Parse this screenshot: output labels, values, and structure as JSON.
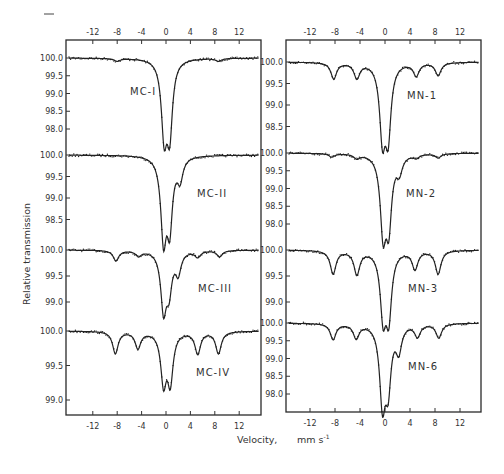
{
  "chart_data": [
    {
      "type": "line",
      "panel": "left",
      "title": "",
      "xlabel": "Velocity, mm s-1",
      "ylabel": "Relative transmission",
      "xlim": [
        -15,
        15
      ],
      "x_ticks": [
        "-12",
        "-8",
        "-4",
        "0",
        "4",
        "8",
        "12"
      ],
      "series": [
        {
          "name": "MC-I",
          "y_ticks": [
            "100.0",
            "99.5",
            "99.0",
            "98.5",
            "98.0"
          ],
          "baseline": 100.0,
          "peaks": [
            {
              "x": -8.0,
              "depth": 0.08
            },
            {
              "x": -0.3,
              "depth": 2.05
            },
            {
              "x": 0.6,
              "depth": 2.0
            },
            {
              "x": 8.6,
              "depth": 0.08
            }
          ]
        },
        {
          "name": "MC-II",
          "y_ticks": [
            "100.0",
            "99.5",
            "99.0",
            "98.5"
          ],
          "baseline": 100.0,
          "peaks": [
            {
              "x": -0.4,
              "depth": 1.85
            },
            {
              "x": 0.6,
              "depth": 1.55
            },
            {
              "x": 2.3,
              "depth": 0.5
            }
          ]
        },
        {
          "name": "MC-III",
          "y_ticks": [
            "100.0",
            "99.5",
            "99.0"
          ],
          "baseline": 100.0,
          "peaks": [
            {
              "x": -8.2,
              "depth": 0.2
            },
            {
              "x": -4.5,
              "depth": 0.1
            },
            {
              "x": -0.4,
              "depth": 1.1
            },
            {
              "x": 0.5,
              "depth": 0.7
            },
            {
              "x": 2.0,
              "depth": 0.4
            },
            {
              "x": 5.2,
              "depth": 0.12
            },
            {
              "x": 8.8,
              "depth": 0.12
            }
          ]
        },
        {
          "name": "MC-IV",
          "y_ticks": [
            "100.0",
            "99.5",
            "99.0"
          ],
          "baseline": 100.0,
          "peaks": [
            {
              "x": -8.3,
              "depth": 0.32
            },
            {
              "x": -4.6,
              "depth": 0.24
            },
            {
              "x": -0.4,
              "depth": 0.72
            },
            {
              "x": 0.7,
              "depth": 0.7
            },
            {
              "x": 5.2,
              "depth": 0.32
            },
            {
              "x": 8.6,
              "depth": 0.32
            }
          ]
        }
      ]
    },
    {
      "type": "line",
      "panel": "right",
      "title": "",
      "xlabel": "Velocity, mm s-1",
      "ylabel": "Relative transmission",
      "xlim": [
        -15,
        15
      ],
      "x_ticks": [
        "-12",
        "-8",
        "-4",
        "0",
        "4",
        "8",
        "12"
      ],
      "series": [
        {
          "name": "MN-1",
          "y_ticks": [
            "100.0",
            "99.5",
            "99.0",
            "98.5"
          ],
          "baseline": 100.0,
          "peaks": [
            {
              "x": -8.2,
              "depth": 0.38
            },
            {
              "x": -4.5,
              "depth": 0.35
            },
            {
              "x": -0.4,
              "depth": 1.65
            },
            {
              "x": 0.5,
              "depth": 1.6
            },
            {
              "x": 5.0,
              "depth": 0.3
            },
            {
              "x": 8.5,
              "depth": 0.3
            }
          ]
        },
        {
          "name": "MN-2",
          "y_ticks": [
            "100.0",
            "99.5",
            "99.0",
            "98.5",
            "98.0"
          ],
          "baseline": 100.0,
          "peaks": [
            {
              "x": -8.5,
              "depth": 0.1
            },
            {
              "x": -4.5,
              "depth": 0.12
            },
            {
              "x": -0.3,
              "depth": 2.1
            },
            {
              "x": 0.6,
              "depth": 1.9
            },
            {
              "x": 2.3,
              "depth": 0.45
            },
            {
              "x": 5.0,
              "depth": 0.1
            },
            {
              "x": 8.5,
              "depth": 0.12
            }
          ]
        },
        {
          "name": "MN-3",
          "y_ticks": [
            "100.0",
            "99.5",
            "99.0"
          ],
          "baseline": 100.0,
          "peaks": [
            {
              "x": -8.3,
              "depth": 0.45
            },
            {
              "x": -4.5,
              "depth": 0.45
            },
            {
              "x": -0.3,
              "depth": 1.2
            },
            {
              "x": 0.6,
              "depth": 1.2
            },
            {
              "x": 4.8,
              "depth": 0.35
            },
            {
              "x": 8.5,
              "depth": 0.45
            }
          ]
        },
        {
          "name": "MN-6",
          "y_ticks": [
            "100.0",
            "99.5",
            "99.0",
            "98.5",
            "98.0"
          ],
          "baseline": 100.0,
          "peaks": [
            {
              "x": -8.3,
              "depth": 0.45
            },
            {
              "x": -4.6,
              "depth": 0.4
            },
            {
              "x": -0.4,
              "depth": 2.15
            },
            {
              "x": 0.5,
              "depth": 1.65
            },
            {
              "x": 2.2,
              "depth": 0.7
            },
            {
              "x": 5.2,
              "depth": 0.35
            },
            {
              "x": 8.6,
              "depth": 0.4
            }
          ]
        }
      ]
    }
  ],
  "figure": {
    "xlabel": "Velocity,",
    "xunit": "mm s",
    "xunit_exp": "-1",
    "ylabel": "Relative transmission",
    "left_ticks": [
      "-12",
      "-8",
      "-4",
      "0",
      "4",
      "8",
      "12"
    ],
    "right_ticks": [
      "-12",
      "-8",
      "-4",
      "0",
      "4",
      "8",
      "12"
    ]
  }
}
